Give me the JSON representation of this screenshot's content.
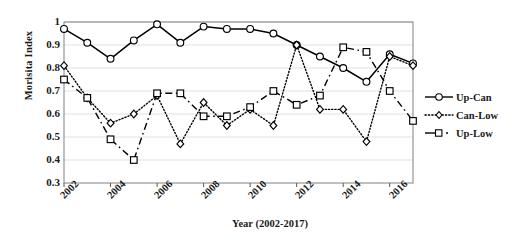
{
  "chart_data": {
    "type": "line",
    "title": "",
    "xlabel": "Year (2002-2017)",
    "ylabel": "Morisita Index",
    "xlim": [
      2002,
      2017
    ],
    "ylim": [
      0.3,
      1.0
    ],
    "xticks": [
      2002,
      2004,
      2006,
      2008,
      2010,
      2012,
      2014,
      2016
    ],
    "yticks": [
      "0.3",
      "0.4",
      "0.5",
      "0.6",
      "0.7",
      "0.8",
      "0.9",
      "1"
    ],
    "grid": true,
    "grid_axis": "y",
    "legend_position": "right",
    "x": [
      2002,
      2003,
      2004,
      2005,
      2006,
      2007,
      2008,
      2009,
      2010,
      2011,
      2012,
      2013,
      2014,
      2015,
      2016,
      2017
    ],
    "series": [
      {
        "name": "Up-Can",
        "marker": "circle",
        "line_style": "solid",
        "color": "#000000",
        "values": [
          0.97,
          0.91,
          0.84,
          0.92,
          0.99,
          0.91,
          0.98,
          0.97,
          0.97,
          0.95,
          0.9,
          0.85,
          0.8,
          0.74,
          0.86,
          0.82
        ]
      },
      {
        "name": "Can-Low",
        "marker": "diamond",
        "line_style": "dotted",
        "color": "#000000",
        "values": [
          0.81,
          0.67,
          0.56,
          0.6,
          0.68,
          0.47,
          0.65,
          0.55,
          0.62,
          0.55,
          0.9,
          0.62,
          0.62,
          0.48,
          0.85,
          0.81
        ]
      },
      {
        "name": "Up-Low",
        "marker": "square",
        "line_style": "dashed",
        "color": "#000000",
        "values": [
          0.75,
          0.67,
          0.49,
          0.4,
          0.69,
          0.69,
          0.59,
          0.59,
          0.63,
          0.7,
          0.64,
          0.68,
          0.89,
          0.87,
          0.7,
          0.57
        ]
      }
    ]
  },
  "axis": {
    "ylabel": "Morisita Index",
    "xlabel": "Year (2002-2017)",
    "yticks": [
      "1",
      "0.9",
      "0.8",
      "0.7",
      "0.6",
      "0.5",
      "0.4",
      "0.3"
    ],
    "xticks": [
      "2002",
      "2004",
      "2006",
      "2008",
      "2010",
      "2012",
      "2014",
      "2016"
    ]
  },
  "legend": {
    "items": [
      {
        "label": "Up-Can",
        "key": "solid-circle-key"
      },
      {
        "label": "Can-Low",
        "key": "dotted-diamond-key"
      },
      {
        "label": "Up-Low",
        "key": "dashed-square-key"
      }
    ]
  }
}
